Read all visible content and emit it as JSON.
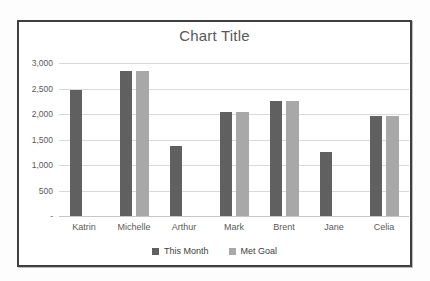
{
  "chart_data": {
    "type": "bar",
    "title": "Chart Title",
    "categories": [
      "Katrin",
      "Michelle",
      "Arthur",
      "Mark",
      "Brent",
      "Jane",
      "Celia"
    ],
    "series": [
      {
        "name": "This Month",
        "color": "#606060",
        "values": [
          2470,
          2850,
          1380,
          2050,
          2250,
          1250,
          1970
        ]
      },
      {
        "name": "Met Goal",
        "color": "#a8a8a8",
        "values": [
          null,
          2850,
          null,
          2050,
          2250,
          null,
          1970
        ]
      }
    ],
    "xlabel": "",
    "ylabel": "",
    "ylim": [
      0,
      3000
    ],
    "ytick_interval": 500,
    "ytick_labels": [
      "-",
      "500",
      "1,000",
      "1,500",
      "2,000",
      "2,500",
      "3,000"
    ],
    "grid": true,
    "legend_position": "bottom",
    "colors": {
      "gridline": "#d9d9d9",
      "axis_text": "#595959",
      "title_text": "#595959",
      "card_border": "#3f3f3f",
      "card_background": "#ffffff"
    }
  }
}
